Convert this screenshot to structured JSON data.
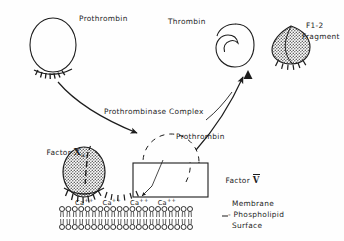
{
  "figure": {
    "ink_color": "#1d1d1d",
    "background_color": "#fefefe",
    "fill_gray": "#9a9a9a"
  },
  "labels": {
    "prothrombin_top": "Prothrombin",
    "thrombin": "Thrombin",
    "fragment_line1": "F1-2",
    "fragment_line2": "Fragment",
    "prothrombinase_complex": "Prothrombinase Complex",
    "prothrombin_complex": "Prothrombin",
    "factor_x_prefix": "Factor ",
    "factor_x_numeral": "X",
    "factor_x_subscript": "a",
    "factor_v_prefix": "Factor ",
    "factor_v_numeral": "V",
    "membrane_line1": "Membrane",
    "membrane_line2": "- Phospholipid",
    "membrane_line3": "Surface"
  },
  "calcium": {
    "ion_label": "Ca",
    "ion_charge": "++",
    "count": 4,
    "items": [
      "Ca",
      "Ca",
      "Ca",
      "Ca"
    ]
  },
  "membrane": {
    "head_count": 21,
    "leaflets": 2
  },
  "shapes": {
    "prothrombin_oval": "open-oval-with-gla-bristles",
    "thrombin_oval": "notched-spiral-oval",
    "fragment_crescent": "stippled-crescent-with-bristles",
    "factor_xa_oval": "stippled-oval-with-bristles",
    "factor_v_box": "rectangle",
    "prothrombin_dashed": "dashed-oval"
  }
}
